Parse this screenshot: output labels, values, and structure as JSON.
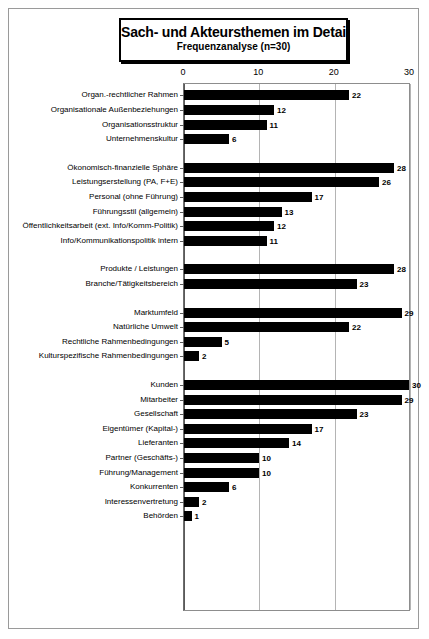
{
  "title": {
    "main": "Sach- und Akteursthemen im Detail",
    "sub": "Frequenzanalyse (n=30)"
  },
  "chart_data": {
    "type": "bar",
    "orientation": "horizontal",
    "title": "Sach- und Akteursthemen im Detail",
    "subtitle": "Frequenzanalyse (n=30)",
    "xlabel": "",
    "ylabel": "",
    "xlim": [
      0,
      30
    ],
    "xticks": [
      0,
      10,
      20,
      30
    ],
    "grid": true,
    "legend": "none",
    "value_labels": true,
    "groups": [
      {
        "name": "group-1",
        "categories": [
          "Organ.-rechtlicher Rahmen",
          "Organisationale Außenbeziehungen",
          "Organisationsstruktur",
          "Unternehmenskultur"
        ],
        "values": [
          22,
          12,
          11,
          6
        ]
      },
      {
        "name": "group-2",
        "categories": [
          "Ökonomisch-finanzielle Sphäre",
          "Leistungserstellung (PA, F+E)",
          "Personal (ohne Führung)",
          "Führungsstil (allgemein)",
          "Öffentlichkeitsarbeit (ext. Info/Komm-Politik)",
          "Info/Kommunikationspolitik intern"
        ],
        "values": [
          28,
          26,
          17,
          13,
          12,
          11
        ]
      },
      {
        "name": "group-3",
        "categories": [
          "Produkte / Leistungen",
          "Branche/Tätigkeitsbereich"
        ],
        "values": [
          28,
          23
        ]
      },
      {
        "name": "group-4",
        "categories": [
          "Marktumfeld",
          "Natürliche Umwelt",
          "Rechtliche Rahmenbedingungen",
          "Kulturspezifische Rahmenbedingungen"
        ],
        "values": [
          29,
          22,
          5,
          2
        ]
      },
      {
        "name": "group-5",
        "categories": [
          "Kunden",
          "Mitarbeiter",
          "Gesellschaft",
          "Eigentümer (Kapital-)",
          "Lieferanten",
          "Partner (Geschäfts-)",
          "Führung/Management",
          "Konkurrenten",
          "Interessenvertretung",
          "Behörden"
        ],
        "values": [
          30,
          29,
          23,
          17,
          14,
          10,
          10,
          6,
          2,
          1
        ]
      }
    ],
    "colors": {
      "bar": "#000000",
      "grid": "#b4b4b4",
      "axis": "#5a5a5a",
      "text": "#000000",
      "background": "#ffffff"
    }
  }
}
